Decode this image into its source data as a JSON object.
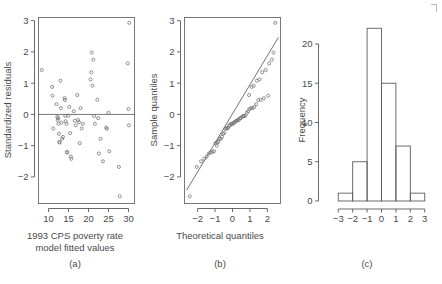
{
  "figure": {
    "panel_labels": [
      "(a)",
      "(b)",
      "(c)"
    ],
    "corner_mark": "crop-mark"
  },
  "chart_data": [
    {
      "type": "scatter",
      "panel": "(a)",
      "title": "",
      "xlabel": "1993 CPS poverty rate model fitted values",
      "xlabel_line1": "1993 CPS poverty rate",
      "xlabel_line2": "model fitted values",
      "ylabel": "Standardized residuals",
      "xlim": [
        7.5,
        31.5
      ],
      "ylim": [
        -2.85,
        3.1
      ],
      "xticks": [
        10,
        15,
        20,
        25,
        30
      ],
      "yticks": [
        -2,
        -1,
        0,
        1,
        2,
        3
      ],
      "xticklabels": [
        "10",
        "15",
        "20",
        "25",
        "30"
      ],
      "yticklabels": [
        "-2",
        "-1",
        "0",
        "1",
        "2",
        "3"
      ],
      "grid": false,
      "reference_line_y": 0,
      "points": [
        [
          8.3,
          1.42
        ],
        [
          10.9,
          0.88
        ],
        [
          11.0,
          0.6
        ],
        [
          11.2,
          -0.45
        ],
        [
          12.0,
          0.33
        ],
        [
          12.2,
          -0.08
        ],
        [
          12.3,
          -0.18
        ],
        [
          12.4,
          -0.12
        ],
        [
          12.5,
          -0.3
        ],
        [
          12.6,
          -0.62
        ],
        [
          12.7,
          -0.88
        ],
        [
          12.8,
          -0.9
        ],
        [
          13.0,
          1.08
        ],
        [
          13.1,
          0.2
        ],
        [
          13.3,
          -0.26
        ],
        [
          13.4,
          -0.78
        ],
        [
          13.6,
          -0.72
        ],
        [
          14.0,
          0.52
        ],
        [
          14.1,
          0.46
        ],
        [
          14.2,
          -0.05
        ],
        [
          14.3,
          -0.22
        ],
        [
          14.5,
          -0.3
        ],
        [
          14.6,
          -1.2
        ],
        [
          14.7,
          -1.22
        ],
        [
          15.0,
          -0.04
        ],
        [
          15.2,
          0.24
        ],
        [
          15.4,
          -0.6
        ],
        [
          15.6,
          -1.35
        ],
        [
          15.7,
          -1.42
        ],
        [
          16.3,
          0.1
        ],
        [
          16.6,
          -0.2
        ],
        [
          16.8,
          -0.35
        ],
        [
          17.2,
          0.62
        ],
        [
          17.4,
          -0.18
        ],
        [
          17.6,
          -0.25
        ],
        [
          17.8,
          -0.92
        ],
        [
          18.0,
          0.2
        ],
        [
          18.3,
          -0.45
        ],
        [
          18.6,
          -0.3
        ],
        [
          20.5,
          1.12
        ],
        [
          20.7,
          1.35
        ],
        [
          20.8,
          1.98
        ],
        [
          21.0,
          0.92
        ],
        [
          21.2,
          1.75
        ],
        [
          21.4,
          -0.05
        ],
        [
          21.6,
          -0.3
        ],
        [
          22.2,
          0.47
        ],
        [
          22.4,
          -0.12
        ],
        [
          22.6,
          -1.25
        ],
        [
          23.0,
          -0.78
        ],
        [
          23.6,
          -1.5
        ],
        [
          24.4,
          -0.42
        ],
        [
          24.6,
          -0.46
        ],
        [
          25.0,
          0.05
        ],
        [
          25.2,
          -1.18
        ],
        [
          27.6,
          -1.68
        ],
        [
          27.8,
          -2.62
        ],
        [
          29.8,
          1.63
        ],
        [
          30.0,
          0.17
        ],
        [
          30.1,
          -0.35
        ],
        [
          30.2,
          2.93
        ]
      ]
    },
    {
      "type": "scatter",
      "panel": "(b)",
      "title": "",
      "xlabel": "Theoretical quantiles",
      "ylabel": "Sample quantiles",
      "xlim": [
        -2.75,
        2.75
      ],
      "ylim": [
        -2.85,
        3.1
      ],
      "xticks": [
        -2,
        -1,
        0,
        1,
        2
      ],
      "yticks": [
        -2,
        -1,
        0,
        1,
        2,
        3
      ],
      "xticklabels": [
        "-2",
        "-1",
        "0",
        "1",
        "2"
      ],
      "yticklabels": [
        "-2",
        "-1",
        "0",
        "1",
        "2",
        "3"
      ],
      "grid": false,
      "qqline": {
        "slope": 0.93,
        "intercept": 0.02
      },
      "points": [
        [
          -2.45,
          -2.62
        ],
        [
          -2.05,
          -1.68
        ],
        [
          -1.8,
          -1.5
        ],
        [
          -1.62,
          -1.42
        ],
        [
          -1.48,
          -1.35
        ],
        [
          -1.36,
          -1.25
        ],
        [
          -1.25,
          -1.22
        ],
        [
          -1.15,
          -1.2
        ],
        [
          -1.06,
          -1.18
        ],
        [
          -0.97,
          -0.92
        ],
        [
          -0.89,
          -0.9
        ],
        [
          -0.82,
          -0.88
        ],
        [
          -0.74,
          -0.78
        ],
        [
          -0.67,
          -0.78
        ],
        [
          -0.61,
          -0.72
        ],
        [
          -0.54,
          -0.62
        ],
        [
          -0.48,
          -0.6
        ],
        [
          -0.42,
          -0.46
        ],
        [
          -0.36,
          -0.45
        ],
        [
          -0.3,
          -0.45
        ],
        [
          -0.25,
          -0.42
        ],
        [
          -0.19,
          -0.35
        ],
        [
          -0.13,
          -0.35
        ],
        [
          -0.08,
          -0.3
        ],
        [
          -0.02,
          -0.3
        ],
        [
          0.02,
          -0.3
        ],
        [
          0.08,
          -0.26
        ],
        [
          0.13,
          -0.25
        ],
        [
          0.19,
          -0.22
        ],
        [
          0.25,
          -0.2
        ],
        [
          0.3,
          -0.18
        ],
        [
          0.36,
          -0.18
        ],
        [
          0.42,
          -0.12
        ],
        [
          0.48,
          -0.12
        ],
        [
          0.54,
          -0.08
        ],
        [
          0.61,
          -0.05
        ],
        [
          0.67,
          -0.05
        ],
        [
          0.74,
          -0.04
        ],
        [
          0.82,
          0.05
        ],
        [
          0.89,
          0.1
        ],
        [
          0.97,
          0.17
        ],
        [
          1.06,
          0.2
        ],
        [
          1.15,
          0.2
        ],
        [
          1.25,
          0.24
        ],
        [
          1.36,
          0.33
        ],
        [
          1.48,
          0.46
        ],
        [
          1.62,
          0.47
        ],
        [
          1.8,
          0.52
        ],
        [
          2.05,
          0.6
        ],
        [
          2.45,
          2.93
        ],
        [
          -0.9,
          -1.0
        ],
        [
          0.95,
          0.62
        ],
        [
          1.1,
          0.88
        ],
        [
          1.22,
          0.92
        ],
        [
          1.4,
          1.08
        ],
        [
          1.55,
          1.12
        ],
        [
          1.7,
          1.35
        ],
        [
          1.9,
          1.42
        ],
        [
          2.1,
          1.63
        ],
        [
          2.25,
          1.75
        ],
        [
          2.35,
          1.98
        ]
      ]
    },
    {
      "type": "bar",
      "panel": "(c)",
      "title": "",
      "xlabel": "",
      "ylabel": "Frequency",
      "xlim": [
        -3.4,
        3.4
      ],
      "ylim": [
        0,
        22.8
      ],
      "xticks": [
        -3,
        -2,
        -1,
        0,
        1,
        2,
        3
      ],
      "yticks": [
        0,
        5,
        10,
        15,
        20
      ],
      "xticklabels": [
        "-3",
        "-2",
        "-1",
        "0",
        "1",
        "2",
        "3"
      ],
      "yticklabels": [
        "0",
        "5",
        "10",
        "15",
        "20"
      ],
      "grid": false,
      "bin_edges": [
        -3,
        -2,
        -1,
        0,
        1,
        2,
        3
      ],
      "categories": [
        "-3 to -2",
        "-2 to -1",
        "-1 to 0",
        "0 to 1",
        "1 to 2",
        "2 to 3"
      ],
      "values": [
        1,
        5,
        22,
        15,
        7,
        1
      ]
    }
  ]
}
